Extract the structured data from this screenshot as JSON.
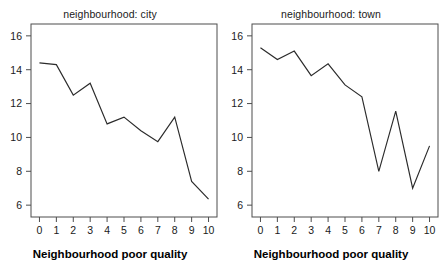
{
  "figure": {
    "background_color": "#ffffff",
    "line_color": "#2b2b2b",
    "axis_color": "#4d4d4d",
    "panel_count": 2
  },
  "panels": [
    {
      "title": "neighbourhood: city",
      "xlabel": "Neighbourhood poor quality",
      "x_tick_labels": [
        "0",
        "1",
        "2",
        "3",
        "4",
        "5",
        "6",
        "7",
        "8",
        "9",
        "10"
      ],
      "y_tick_labels": [
        "6",
        "8",
        "10",
        "12",
        "14",
        "16"
      ]
    },
    {
      "title": "neighbourhood: town",
      "xlabel": "Neighbourhood poor quality",
      "x_tick_labels": [
        "0",
        "1",
        "2",
        "3",
        "4",
        "5",
        "6",
        "7",
        "8",
        "9",
        "10"
      ],
      "y_tick_labels": [
        "6",
        "8",
        "10",
        "12",
        "14",
        "16"
      ]
    }
  ],
  "chart_data": [
    {
      "type": "line",
      "title": "neighbourhood: city",
      "xlabel": "Neighbourhood poor quality",
      "ylabel": "",
      "x": [
        0,
        1,
        2,
        3,
        4,
        5,
        6,
        7,
        8,
        9,
        10
      ],
      "values": [
        14.4,
        14.3,
        12.5,
        13.2,
        10.8,
        11.2,
        10.4,
        9.75,
        11.2,
        7.4,
        6.35
      ],
      "xlim": [
        -0.5,
        10.5
      ],
      "ylim": [
        5.3,
        16.7
      ],
      "x_ticks": [
        0,
        1,
        2,
        3,
        4,
        5,
        6,
        7,
        8,
        9,
        10
      ],
      "y_ticks": [
        6,
        8,
        10,
        12,
        14,
        16
      ],
      "grid": false,
      "legend": "none"
    },
    {
      "type": "line",
      "title": "neighbourhood: town",
      "xlabel": "Neighbourhood poor quality",
      "ylabel": "",
      "x": [
        0,
        1,
        2,
        3,
        4,
        5,
        6,
        7,
        8,
        9,
        10
      ],
      "values": [
        15.3,
        14.6,
        15.1,
        13.65,
        14.35,
        13.1,
        12.4,
        8.0,
        11.55,
        7.0,
        9.5
      ],
      "xlim": [
        -0.5,
        10.5
      ],
      "ylim": [
        5.3,
        16.7
      ],
      "x_ticks": [
        0,
        1,
        2,
        3,
        4,
        5,
        6,
        7,
        8,
        9,
        10
      ],
      "y_ticks": [
        6,
        8,
        10,
        12,
        14,
        16
      ],
      "grid": false,
      "legend": "none"
    }
  ]
}
